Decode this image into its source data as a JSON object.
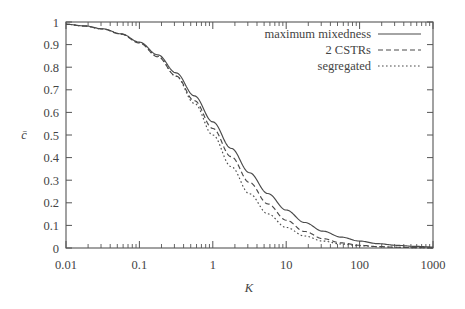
{
  "chart_data": {
    "type": "line",
    "title": "",
    "xlabel": "K",
    "ylabel": "c̄",
    "xscale": "log",
    "yscale": "linear",
    "xlim": [
      0.01,
      1000
    ],
    "ylim": [
      0,
      1
    ],
    "grid": false,
    "legend_position": "top-right",
    "xticks": [
      0.01,
      0.1,
      1,
      10,
      100,
      1000
    ],
    "xtick_labels": [
      "0.01",
      "0.1",
      "1",
      "10",
      "100",
      "1000"
    ],
    "yticks": [
      0,
      0.1,
      0.2,
      0.3,
      0.4,
      0.5,
      0.6,
      0.7,
      0.8,
      0.9,
      1
    ],
    "ytick_labels": [
      "0",
      "0.1",
      "0.2",
      "0.3",
      "0.4",
      "0.5",
      "0.6",
      "0.7",
      "0.8",
      "0.9",
      "1"
    ],
    "series": [
      {
        "name": "maximum mixedness",
        "style": "solid",
        "color": "#4a4a4a",
        "x": [
          0.01,
          0.0178,
          0.0316,
          0.0562,
          0.1,
          0.178,
          0.316,
          0.562,
          1.0,
          1.78,
          3.16,
          5.62,
          10.0,
          17.8,
          31.6,
          56.2,
          100.0,
          178.0,
          316.0,
          562.0,
          1000.0
        ],
        "y": [
          0.99,
          0.983,
          0.97,
          0.948,
          0.911,
          0.855,
          0.775,
          0.673,
          0.558,
          0.441,
          0.333,
          0.241,
          0.168,
          0.113,
          0.0745,
          0.0481,
          0.0306,
          0.0192,
          0.0119,
          0.0073,
          0.0045
        ]
      },
      {
        "name": "2 CSTRs",
        "style": "dashed",
        "color": "#4a4a4a",
        "x": [
          0.01,
          0.0178,
          0.0316,
          0.0562,
          0.1,
          0.178,
          0.316,
          0.562,
          1.0,
          1.78,
          3.16,
          5.62,
          10.0,
          17.8,
          31.6,
          56.2,
          100.0,
          178.0,
          316.0,
          562.0,
          1000.0
        ],
        "y": [
          0.99,
          0.982,
          0.969,
          0.946,
          0.907,
          0.846,
          0.761,
          0.652,
          0.529,
          0.404,
          0.29,
          0.195,
          0.123,
          0.0731,
          0.0414,
          0.0226,
          0.0121,
          0.0063,
          0.0032,
          0.0016,
          0.0008
        ]
      },
      {
        "name": "segregated",
        "style": "dotted",
        "color": "#4a4a4a",
        "x": [
          0.01,
          0.0178,
          0.0316,
          0.0562,
          0.1,
          0.178,
          0.316,
          0.562,
          1.0,
          1.78,
          3.16,
          5.62,
          10.0,
          17.8,
          31.6,
          56.2,
          100.0,
          178.0,
          316.0,
          562.0,
          1000.0
        ],
        "y": [
          0.99,
          0.982,
          0.969,
          0.947,
          0.909,
          0.849,
          0.76,
          0.64,
          0.5,
          0.36,
          0.24,
          0.151,
          0.0909,
          0.0532,
          0.0307,
          0.0175,
          0.0099,
          0.00559,
          0.00315,
          0.00178,
          0.000999
        ]
      }
    ]
  },
  "legend": {
    "entries": [
      {
        "label": "maximum mixedness",
        "style": "solid"
      },
      {
        "label": "2 CSTRs",
        "style": "dashed"
      },
      {
        "label": "segregated",
        "style": "dotted"
      }
    ]
  },
  "axes": {
    "x_title": "K",
    "y_title": "c̄"
  }
}
